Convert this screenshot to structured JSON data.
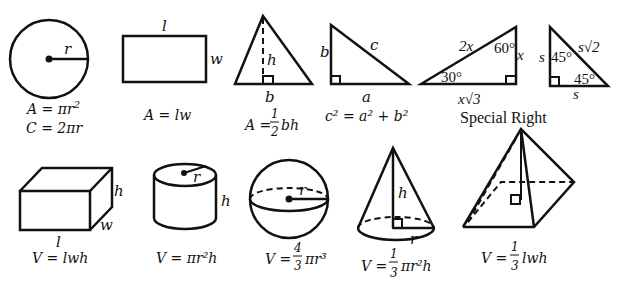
{
  "shapes_2d": [
    {
      "name": "circle",
      "labels": [
        "r"
      ],
      "formulas": [
        "A = πr²",
        "C = 2πr"
      ]
    },
    {
      "name": "rectangle",
      "labels": [
        "l",
        "w"
      ],
      "formulas": [
        "A = lw"
      ]
    },
    {
      "name": "triangle",
      "labels": [
        "h",
        "b"
      ],
      "formulas": [
        "A = ½bh"
      ]
    },
    {
      "name": "right-triangle",
      "labels": [
        "b",
        "c",
        "a"
      ],
      "formulas": [
        "c² = a² + b²"
      ]
    },
    {
      "name": "30-60-90-triangle",
      "labels": [
        "2x",
        "60°",
        "x",
        "30°",
        "x√3"
      ]
    },
    {
      "name": "45-45-90-triangle",
      "labels": [
        "s",
        "45°",
        "s√2",
        "45°",
        "s"
      ]
    }
  ],
  "special_right_caption": "Special Right",
  "shapes_3d": [
    {
      "name": "rectangular-prism",
      "labels": [
        "h",
        "w",
        "l"
      ],
      "formulas": [
        "V = lwh"
      ]
    },
    {
      "name": "cylinder",
      "labels": [
        "r",
        "h"
      ],
      "formulas": [
        "V = πr²h"
      ]
    },
    {
      "name": "sphere",
      "labels": [
        "r"
      ],
      "formulas": [
        "V = 4/3 πr³"
      ]
    },
    {
      "name": "cone",
      "labels": [
        "h",
        "r"
      ],
      "formulas": [
        "V = 1/3 πr²h"
      ]
    },
    {
      "name": "pyramid",
      "labels": [],
      "formulas": [
        "V = 1/3 lwh"
      ]
    }
  ],
  "text": {
    "circle_r": "r",
    "circle_f1": "A = πr",
    "circle_f2": "C = 2πr",
    "rect_l": "l",
    "rect_w": "w",
    "rect_f": "A = lw",
    "tri_h": "h",
    "tri_b": "b",
    "tri_f_pre": "A =",
    "tri_f_num": "1",
    "tri_f_den": "2",
    "tri_f_post": "bh",
    "rt_b": "b",
    "rt_c": "c",
    "rt_a": "a",
    "rt_f": "c² = a² + b²",
    "t30_2x": "2x",
    "t30_60": "60°",
    "t30_x": "x",
    "t30_30": "30°",
    "t30_xr3": "x√3",
    "t45_s": "s",
    "t45_45a": "45°",
    "t45_sr2": "s√2",
    "t45_45b": "45°",
    "t45_sb": "s",
    "special": "Special Right",
    "box_h": "h",
    "box_w": "w",
    "box_l": "l",
    "box_f": "V = lwh",
    "cyl_r": "r",
    "cyl_h": "h",
    "cyl_f": "V = πr²h",
    "sph_r": "r",
    "sph_pre": "V =",
    "sph_num": "4",
    "sph_den": "3",
    "sph_post": "πr³",
    "cone_h": "h",
    "cone_r": "r",
    "cone_pre": "V =",
    "cone_num": "1",
    "cone_den": "3",
    "cone_post": "πr²h",
    "pyr_pre": "V =",
    "pyr_num": "1",
    "pyr_den": "3",
    "pyr_post": "lwh"
  }
}
